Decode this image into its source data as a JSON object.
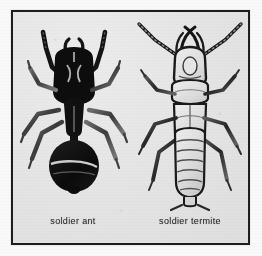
{
  "figure": {
    "kind": "scanned-illustration",
    "colors": {
      "page_background": "#f8f8f8",
      "plate_background": "#e6e6e6",
      "frame_border": "#1d1d1d",
      "ink_dark": "#141414",
      "ink_mid": "#5a5a5a",
      "body_pale": "#dcdcdc",
      "caption_text": "#2a2a2a"
    },
    "specimens": [
      {
        "id": "soldier-ant",
        "caption": "soldier ant",
        "body_color": "solid black",
        "antenna_type": "elbowed",
        "waist": "narrow petiole",
        "abdomen": "rounded gaster",
        "leg_count": 6
      },
      {
        "id": "soldier-termite",
        "caption": "soldier termite",
        "body_color": "pale with dark outline",
        "antenna_type": "straight beaded",
        "waist": "broad, no constriction",
        "abdomen": "segmented, banded",
        "leg_count": 6
      }
    ]
  },
  "captions": {
    "ant": "soldier ant",
    "termite": "soldier termite"
  }
}
